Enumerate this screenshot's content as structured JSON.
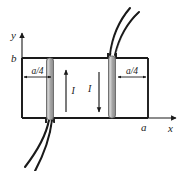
{
  "figure": {
    "type": "physics-diagram",
    "colors": {
      "outline": "#1a1a1a",
      "bar_fill": "#9e9e9e",
      "bar_highlight": "#d4d4d4",
      "bar_edge": "#4a4a4a",
      "background": "#ffffff",
      "axis": "#1a1a1a"
    },
    "axes": {
      "y_label": "y",
      "x_label": "x",
      "origin_label": "",
      "y_top_tick_label": "b",
      "x_right_tick_label": "a"
    },
    "dimensions": [
      {
        "name": "left-gap",
        "label": "a/4"
      },
      {
        "name": "right-gap",
        "label": "a/4"
      }
    ],
    "currents": [
      {
        "name": "left-current",
        "label": "I",
        "direction": "up"
      },
      {
        "name": "right-current",
        "label": "I",
        "direction": "down"
      }
    ],
    "bars": [
      {
        "name": "left-bar",
        "exits": "bottom"
      },
      {
        "name": "right-bar",
        "exits": "top"
      }
    ],
    "leads": [
      {
        "name": "lead-bottom-outer"
      },
      {
        "name": "lead-bottom-inner"
      },
      {
        "name": "lead-top-outer"
      },
      {
        "name": "lead-top-inner"
      }
    ]
  }
}
